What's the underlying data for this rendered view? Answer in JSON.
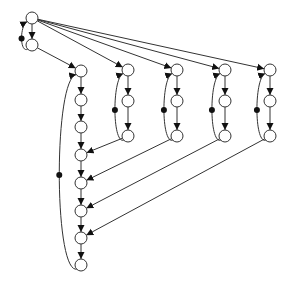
{
  "diagram": {
    "type": "directed-graph",
    "node_radius": 6,
    "colors": {
      "stroke": "#333333",
      "node_fill": "#ffffff",
      "arrow": "#111111",
      "background": "#ffffff"
    },
    "nodes": [
      {
        "id": "root",
        "x": 32,
        "y": 18
      },
      {
        "id": "root2",
        "x": 32,
        "y": 45
      },
      {
        "id": "m1",
        "x": 81,
        "y": 71
      },
      {
        "id": "m2",
        "x": 81,
        "y": 100
      },
      {
        "id": "m3",
        "x": 81,
        "y": 127
      },
      {
        "id": "m4",
        "x": 81,
        "y": 155
      },
      {
        "id": "m5",
        "x": 81,
        "y": 183
      },
      {
        "id": "m6",
        "x": 81,
        "y": 211
      },
      {
        "id": "m7",
        "x": 81,
        "y": 238
      },
      {
        "id": "m8",
        "x": 81,
        "y": 265
      },
      {
        "id": "a1",
        "x": 128,
        "y": 70
      },
      {
        "id": "a2",
        "x": 128,
        "y": 101
      },
      {
        "id": "a3",
        "x": 128,
        "y": 136
      },
      {
        "id": "b1",
        "x": 177,
        "y": 70
      },
      {
        "id": "b2",
        "x": 177,
        "y": 101
      },
      {
        "id": "b3",
        "x": 177,
        "y": 136
      },
      {
        "id": "c1",
        "x": 225,
        "y": 70
      },
      {
        "id": "c2",
        "x": 225,
        "y": 101
      },
      {
        "id": "c3",
        "x": 225,
        "y": 136
      },
      {
        "id": "d1",
        "x": 270,
        "y": 70
      },
      {
        "id": "d2",
        "x": 270,
        "y": 101
      },
      {
        "id": "d3",
        "x": 270,
        "y": 136
      }
    ],
    "edges": [
      {
        "from": "root",
        "to": "root2",
        "arrow": true
      },
      {
        "from": "root2",
        "to": "root",
        "curve": "loop-left",
        "dot": true,
        "arrow": true
      },
      {
        "from": "root2",
        "to": "m1",
        "arrow": true
      },
      {
        "from": "root",
        "to": "a1",
        "arrow": true
      },
      {
        "from": "root",
        "to": "b1",
        "arrow": true
      },
      {
        "from": "root",
        "to": "c1",
        "arrow": true
      },
      {
        "from": "root",
        "to": "d1",
        "arrow": true
      },
      {
        "from": "m1",
        "to": "m2",
        "arrow": true
      },
      {
        "from": "m2",
        "to": "m3",
        "arrow": true
      },
      {
        "from": "m3",
        "to": "m4",
        "arrow": true
      },
      {
        "from": "m4",
        "to": "m5",
        "arrow": true
      },
      {
        "from": "m5",
        "to": "m6",
        "arrow": true
      },
      {
        "from": "m6",
        "to": "m7",
        "arrow": true
      },
      {
        "from": "m7",
        "to": "m8",
        "arrow": true
      },
      {
        "from": "m8",
        "to": "m1",
        "curve": "loop-left",
        "dot": true,
        "arrow": true
      },
      {
        "from": "a1",
        "to": "a2",
        "arrow": true
      },
      {
        "from": "a2",
        "to": "a3",
        "arrow": true
      },
      {
        "from": "a3",
        "to": "a1",
        "curve": "loop-left",
        "dot": true,
        "arrow": true
      },
      {
        "from": "b1",
        "to": "b2",
        "arrow": true
      },
      {
        "from": "b2",
        "to": "b3",
        "arrow": true
      },
      {
        "from": "b3",
        "to": "b1",
        "curve": "loop-left",
        "dot": true,
        "arrow": true
      },
      {
        "from": "c1",
        "to": "c2",
        "arrow": true
      },
      {
        "from": "c2",
        "to": "c3",
        "arrow": true
      },
      {
        "from": "c3",
        "to": "c1",
        "curve": "loop-left",
        "dot": true,
        "arrow": true
      },
      {
        "from": "d1",
        "to": "d2",
        "arrow": true
      },
      {
        "from": "d2",
        "to": "d3",
        "arrow": true
      },
      {
        "from": "d3",
        "to": "d1",
        "curve": "loop-left",
        "dot": true,
        "arrow": true
      },
      {
        "from": "a3",
        "to": "m4",
        "arrow": true
      },
      {
        "from": "b3",
        "to": "m5",
        "arrow": true
      },
      {
        "from": "c3",
        "to": "m6",
        "arrow": true
      },
      {
        "from": "d3",
        "to": "m7",
        "arrow": true
      }
    ]
  }
}
